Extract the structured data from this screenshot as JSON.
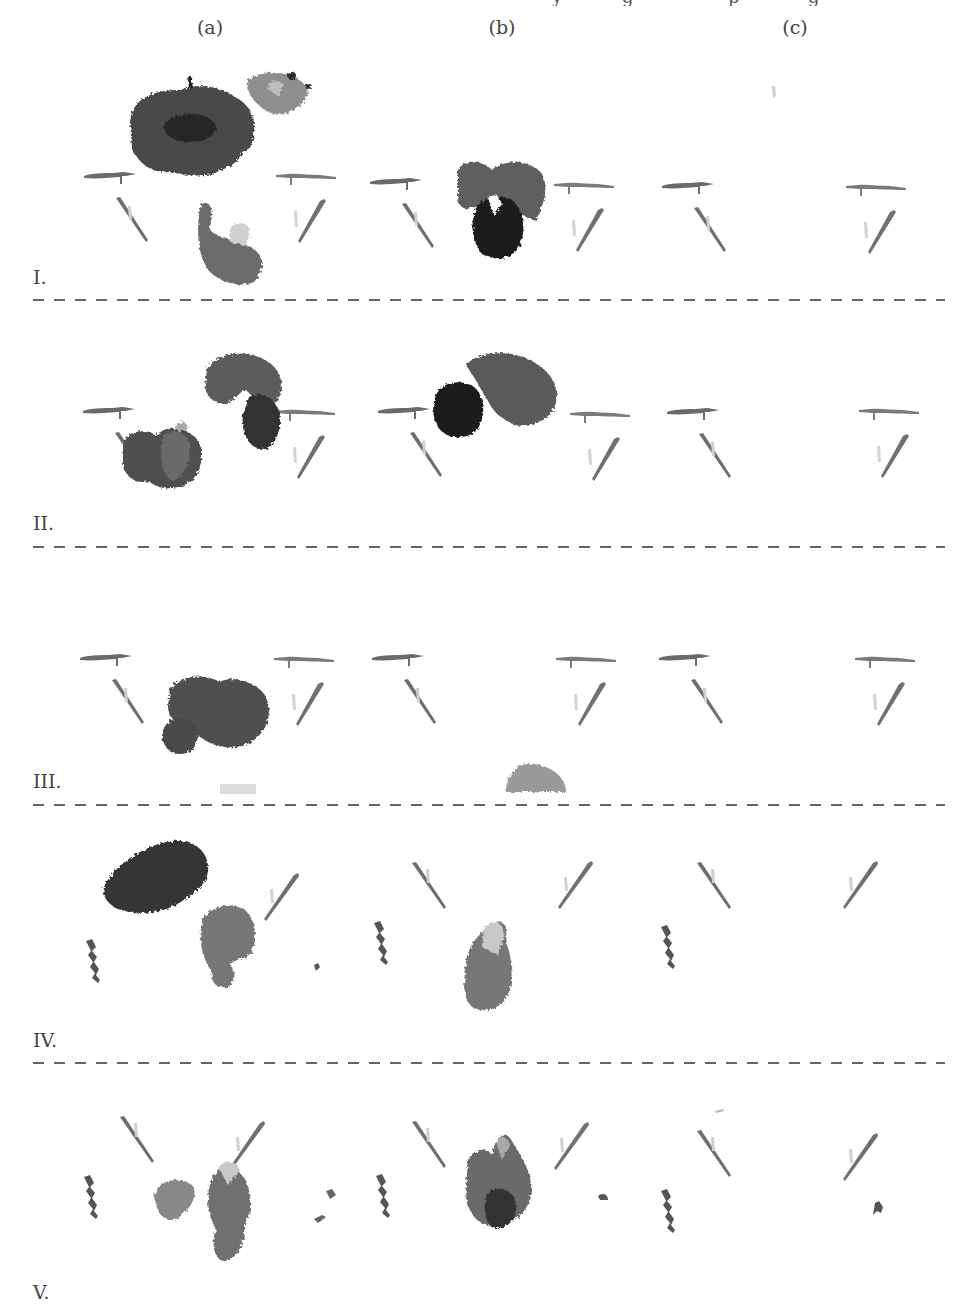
{
  "figure": {
    "top_cropped_text": [
      "y",
      "g",
      "p",
      "g"
    ],
    "columns": [
      {
        "label": "(a)",
        "x": 210
      },
      {
        "label": "(b)",
        "x": 502
      },
      {
        "label": "(c)",
        "x": 795
      }
    ],
    "rows": [
      {
        "label": "I.",
        "label_y": 268,
        "separator_y": 299
      },
      {
        "label": "II.",
        "label_y": 514,
        "separator_y": 546
      },
      {
        "label": "III.",
        "label_y": 772,
        "separator_y": 804
      },
      {
        "label": "IV.",
        "label_y": 1031,
        "separator_y": 1062
      },
      {
        "label": "V.",
        "label_y": 1283,
        "separator_y": null
      }
    ],
    "content_description": "Grid of grayscale depth-rendered point clouds (scene with two arm-like structures and objects); darker = nearer",
    "colors": {
      "background": "#ffffff",
      "separator": "#666666",
      "dark_object": "#2a2a2a",
      "mid_object": "#5c5c5c",
      "light_object": "#9a9a9a",
      "faint": "#c8c8c8"
    }
  }
}
